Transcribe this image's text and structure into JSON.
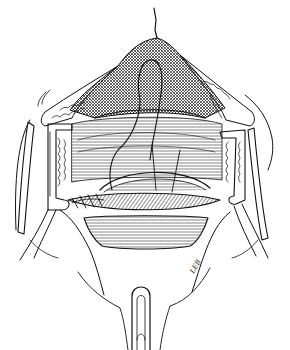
{
  "figure": {
    "type": "surgical line illustration",
    "style": "black ink line drawing on white",
    "colors": {
      "ink": "#111111",
      "background": "#ffffff",
      "hatch": "#333333"
    },
    "signature": "LEB",
    "elements": [
      "peritoneal-cone-with-tip",
      "left-retractor-blade",
      "right-retractor-blade",
      "left-abdominal-wall-fat",
      "right-abdominal-wall-fat",
      "suture-loop",
      "sutured-incision",
      "lower-retracted-tissue",
      "bottom-instrument-handle"
    ]
  }
}
